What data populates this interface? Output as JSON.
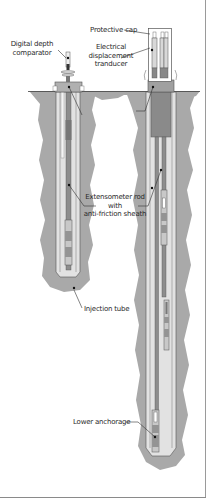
{
  "figure": {
    "colors": {
      "ground": "#a9a9a9",
      "grout": "#c7c7c7",
      "borehole": "#e4e4e4",
      "rod": "#8a8a8a",
      "cap": "#909090",
      "outline": "#555555",
      "frame": "#8a8a8a"
    }
  },
  "labels": {
    "digital_depth_comparator": [
      "Digital depth",
      "comparator"
    ],
    "protective_cap": "Protective cap",
    "electrical_displacement_transducer": [
      "Electrical",
      "displacement",
      "tranducer"
    ],
    "extensometer_rod": [
      "Extensometer rod",
      "with",
      "anti-friction sheath"
    ],
    "injection_tube": "Injection tube",
    "lower_anchorage": "Lower anchorage"
  }
}
